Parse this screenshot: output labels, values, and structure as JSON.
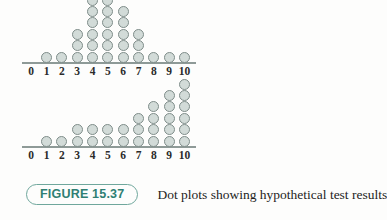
{
  "figure": {
    "label": "FIGURE 15.37",
    "caption": "Dot plots showing hypothetical test results",
    "accent_color": "#2f7f73",
    "pill_border_color": "#6fa79c"
  },
  "chart_data": [
    {
      "type": "dot",
      "name": "upper-dot-plot",
      "title": "",
      "xlabel": "",
      "ylabel": "",
      "categories": [
        "0",
        "1",
        "2",
        "3",
        "4",
        "5",
        "6",
        "7",
        "8",
        "9",
        "10"
      ],
      "values": [
        0,
        1,
        1,
        3,
        6,
        6,
        5,
        3,
        1,
        1,
        1
      ],
      "xlim": [
        0,
        10
      ],
      "grid": false,
      "legend": "none",
      "dot_fill": "#d2dbd8",
      "dot_stroke": "#7f8d8a",
      "axis_color": "#8e9a97"
    },
    {
      "type": "dot",
      "name": "lower-dot-plot",
      "title": "",
      "xlabel": "",
      "ylabel": "",
      "categories": [
        "0",
        "1",
        "2",
        "3",
        "4",
        "5",
        "6",
        "7",
        "8",
        "9",
        "10"
      ],
      "values": [
        0,
        1,
        1,
        2,
        2,
        2,
        2,
        3,
        4,
        5,
        6
      ],
      "xlim": [
        0,
        10
      ],
      "grid": false,
      "legend": "none",
      "dot_fill": "#d2dbd8",
      "dot_stroke": "#7f8d8a",
      "axis_color": "#8e9a97"
    }
  ]
}
